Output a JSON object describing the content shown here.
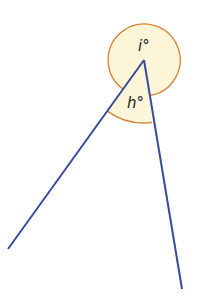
{
  "diagram": {
    "type": "angles-at-a-point",
    "vertex": [
      144,
      60
    ],
    "rays": [
      {
        "name": "left-ray",
        "end": [
          8,
          249
        ]
      },
      {
        "name": "right-ray",
        "end": [
          182,
          289
        ]
      }
    ],
    "angles": [
      {
        "label": "i°",
        "kind": "reflex",
        "position": "above vertex"
      },
      {
        "label": "h°",
        "kind": "acute",
        "position": "between rays"
      }
    ],
    "colors": {
      "line": "#3a4a9a",
      "arc": "#d9823a",
      "fill": "#fdf5d8"
    }
  }
}
